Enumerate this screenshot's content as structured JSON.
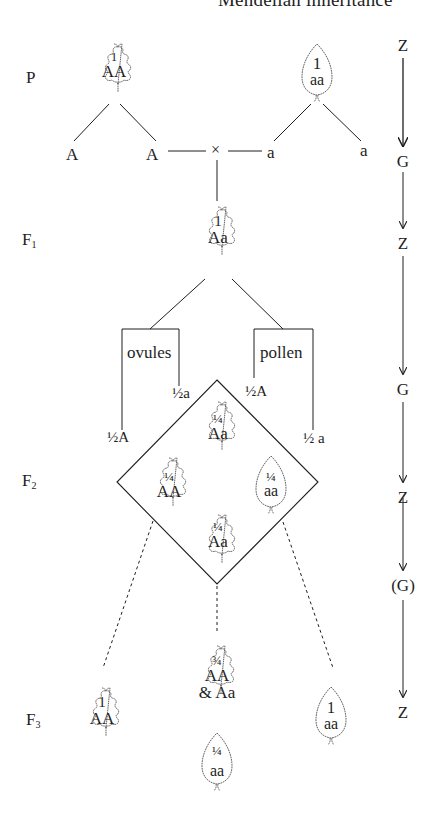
{
  "title": "Mendelian inheritance",
  "generations": {
    "P": {
      "label": "P",
      "sub": ""
    },
    "F1": {
      "label": "F",
      "sub": "1"
    },
    "F2": {
      "label": "F",
      "sub": "2"
    },
    "F3": {
      "label": "F",
      "sub": "3"
    }
  },
  "parents": {
    "left": {
      "fraction": "1",
      "genotype": "AA",
      "shape": "lobed-leaf"
    },
    "right": {
      "fraction": "1",
      "genotype": "aa",
      "shape": "serrated-leaf"
    }
  },
  "parent_gametes": {
    "left": [
      "A",
      "A"
    ],
    "right": [
      "a",
      "a"
    ],
    "cross_symbol": "×"
  },
  "f1": {
    "fraction": "1",
    "genotype": "Aa",
    "shape": "lobed-leaf"
  },
  "gamete_groups": {
    "ovules": {
      "label": "ovules",
      "gametes": [
        "½A",
        "½a"
      ]
    },
    "pollen": {
      "label": "pollen",
      "gametes": [
        "½A",
        "½ a"
      ]
    }
  },
  "f2_square": [
    {
      "position": "top",
      "fraction": "¼",
      "genotype": "Aa",
      "shape": "lobed-leaf"
    },
    {
      "position": "left",
      "fraction": "¼",
      "genotype": "AA",
      "shape": "lobed-leaf"
    },
    {
      "position": "right",
      "fraction": "¼",
      "genotype": "aa",
      "shape": "serrated-leaf"
    },
    {
      "position": "bottom",
      "fraction": "¼",
      "genotype": "Aa",
      "shape": "lobed-leaf"
    }
  ],
  "f3": {
    "left": {
      "fraction": "1",
      "genotype": "AA",
      "shape": "lobed-leaf"
    },
    "center_top": {
      "fraction": "¾",
      "genotype": "AA",
      "genotype2": "& Aa",
      "shape": "lobed-leaf"
    },
    "center_bottom": {
      "fraction": "¼",
      "genotype": "aa",
      "shape": "serrated-leaf"
    },
    "right": {
      "fraction": "1",
      "genotype": "aa",
      "shape": "serrated-leaf"
    }
  },
  "life_cycle_column": [
    "Z",
    "G",
    "Z",
    "G",
    "Z",
    "(G)",
    "Z"
  ],
  "colors": {
    "ink": "#1e1e1e",
    "background": "#ffffff"
  }
}
